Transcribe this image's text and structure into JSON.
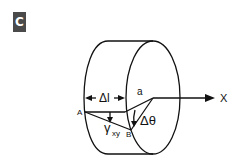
{
  "panel": {
    "label": "C",
    "badge_color": "#4a4a4a"
  },
  "diagram": {
    "labels": {
      "delta_l": "Δl",
      "point_A": "A",
      "point_B": "B",
      "point_a": "a",
      "gamma": "γ",
      "gamma_sub": "xy",
      "delta_theta": "Δθ",
      "axis": "X"
    },
    "stroke_color": "#111111"
  }
}
